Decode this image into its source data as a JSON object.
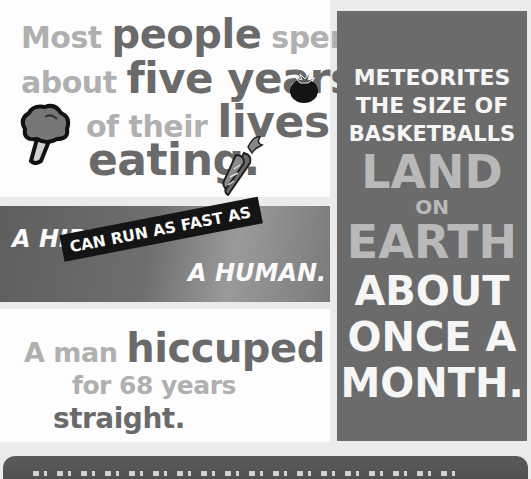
{
  "facts": {
    "eating": {
      "lines": [
        [
          "Most ",
          "people",
          " spend"
        ],
        [
          "about ",
          "five years"
        ],
        [
          "of their ",
          "lives"
        ],
        [
          "eating."
        ]
      ],
      "icons": [
        "broccoli-icon",
        "tomato-icon",
        "carrot-icon"
      ]
    },
    "hippo": {
      "line1": "A HIPPO",
      "band": "CAN RUN AS FAST AS",
      "line2": "A HUMAN."
    },
    "hiccup": {
      "line1_light": "A man ",
      "line1_dark": "hiccuped",
      "line2": "for 68 years",
      "line3": "straight."
    },
    "meteorites": {
      "lines": [
        "METEORITES",
        "THE SIZE OF",
        "BASKETBALLS",
        "LAND",
        "ON",
        "EARTH",
        "ABOUT",
        "ONCE A",
        "MONTH."
      ]
    }
  },
  "colors": {
    "panel_light": "#fdfdfd",
    "panel_dark": "#6b6b6b",
    "text_light": "#b0b0b0",
    "text_dark": "#6a6a6a",
    "background": "#ebebeb"
  }
}
